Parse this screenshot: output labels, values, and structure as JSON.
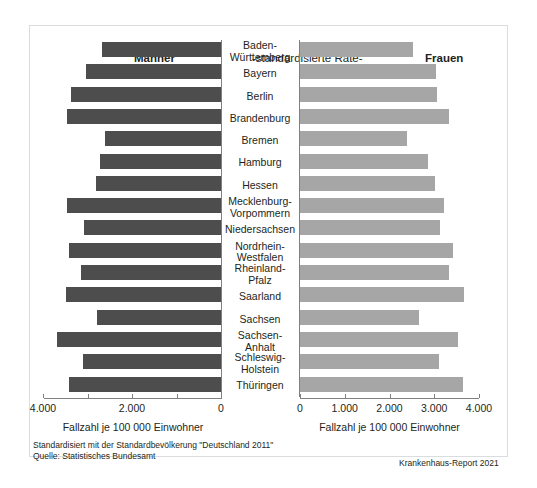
{
  "header": {
    "men_label": "Männer",
    "center_label": "-standardisierte Rate-",
    "women_label": "Frauen"
  },
  "axis": {
    "left_title": "Fallzahl je 100 000 Einwohner",
    "right_title": "Fallzahl je 100 000 Einwohner",
    "left_ticks": [
      "4.000",
      "2.000",
      "0"
    ],
    "right_ticks": [
      "0",
      "1.000",
      "2.000",
      "3.000",
      "4.000"
    ]
  },
  "footnotes": {
    "line1": "Standardisiert mit der Standardbevölkerung \"Deutschland 2011\"",
    "line2": "Quelle: Statistisches Bundesamt",
    "source": "Krankenhaus-Report 2021"
  },
  "colors": {
    "men_bar": "#4d4d4d",
    "women_bar": "#a6a6a6",
    "axis": "#808080",
    "frame": "#d9dde0"
  },
  "chart_data": {
    "type": "bar",
    "title": "-standardisierte Rate-",
    "orientation": "horizontal-diverging",
    "xlabel": "Fallzahl je 100 000 Einwohner",
    "ylabel": "",
    "xlim_left": [
      4000,
      0
    ],
    "xlim_right": [
      0,
      4000
    ],
    "grid": false,
    "legend_position": "top",
    "categories": [
      "Baden-Württemberg",
      "Bayern",
      "Berlin",
      "Brandenburg",
      "Bremen",
      "Hamburg",
      "Hessen",
      "Mecklenburg-Vorpommern",
      "Niedersachsen",
      "Nordrhein-Westfalen",
      "Rheinland-Pfalz",
      "Saarland",
      "Sachsen",
      "Sachsen-Anhalt",
      "Schleswig-Holstein",
      "Thüringen"
    ],
    "category_lines": [
      [
        "Baden-",
        "Württemberg"
      ],
      [
        "Bayern"
      ],
      [
        "Berlin"
      ],
      [
        "Brandenburg"
      ],
      [
        "Bremen"
      ],
      [
        "Hamburg"
      ],
      [
        "Hessen"
      ],
      [
        "Mecklenburg-",
        "Vorpommern"
      ],
      [
        "Niedersachsen"
      ],
      [
        "Nordrhein-",
        "Westfalen"
      ],
      [
        "Rheinland-",
        "Pfalz"
      ],
      [
        "Saarland"
      ],
      [
        "Sachsen"
      ],
      [
        "Sachsen-",
        "Anhalt"
      ],
      [
        "Schleswig-",
        "Holstein"
      ],
      [
        "Thüringen"
      ]
    ],
    "series": [
      {
        "name": "Männer",
        "color": "#4d4d4d",
        "values": [
          2670,
          3030,
          3370,
          3460,
          2600,
          2710,
          2800,
          3460,
          3070,
          3410,
          3140,
          3480,
          2780,
          3680,
          3100,
          3410
        ]
      },
      {
        "name": "Frauen",
        "color": "#a6a6a6",
        "values": [
          2520,
          3030,
          3060,
          3330,
          2380,
          2850,
          3010,
          3210,
          3120,
          3420,
          3330,
          3660,
          2650,
          3530,
          3100,
          3640
        ]
      }
    ]
  }
}
